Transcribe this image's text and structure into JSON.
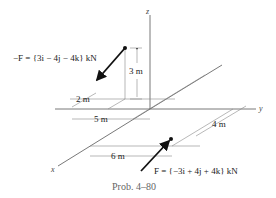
{
  "figure": {
    "axes": {
      "x": "x",
      "y": "y",
      "z": "z"
    },
    "forces": {
      "neg_F": "−F = {3i − 4j − 4k} kN",
      "F": "F = {−3i + 4j + 4k} kN"
    },
    "dimensions": {
      "d3": "3 m",
      "d2": "2 m",
      "d5": "5 m",
      "d6": "6 m",
      "d4": "4 m"
    },
    "caption": "Prob. 4–80"
  }
}
